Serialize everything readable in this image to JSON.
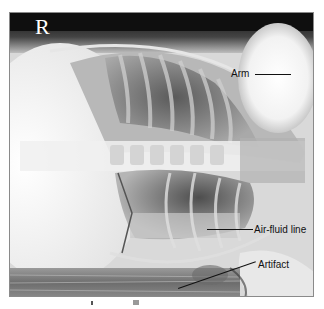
{
  "figure": {
    "type": "radiograph",
    "view": "lateral decubitus chest radiograph",
    "side_marker": "R",
    "annotations": [
      {
        "id": "arm",
        "label": "Arm"
      },
      {
        "id": "air-fluid-line",
        "label": "Air-fluid line"
      },
      {
        "id": "artifact",
        "label": "Artifact"
      }
    ],
    "colors": {
      "background_dark": "#111111",
      "bone_bright": "#f4f4f4",
      "lung_dark": "#555555",
      "annotation_text": "#111111",
      "marker_text": "#ffffff"
    }
  }
}
